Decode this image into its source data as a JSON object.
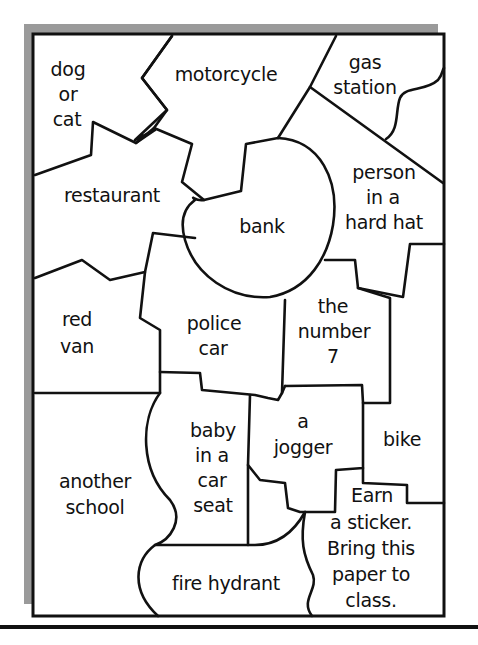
{
  "worksheet": {
    "title": "Scavenger hunt map",
    "cells": [
      {
        "id": "dog-or-cat",
        "lines": [
          "dog",
          "or",
          "cat"
        ]
      },
      {
        "id": "motorcycle",
        "lines": [
          "motorcycle"
        ]
      },
      {
        "id": "gas-station",
        "lines": [
          "gas",
          "station"
        ]
      },
      {
        "id": "restaurant",
        "lines": [
          "restaurant"
        ]
      },
      {
        "id": "bank",
        "lines": [
          "bank"
        ]
      },
      {
        "id": "person-in-a-hard-hat",
        "lines": [
          "person",
          "in a",
          "hard hat"
        ]
      },
      {
        "id": "red-van",
        "lines": [
          "red",
          "van"
        ]
      },
      {
        "id": "police-car",
        "lines": [
          "police",
          "car"
        ]
      },
      {
        "id": "the-number-7",
        "lines": [
          "the",
          "number",
          "7"
        ]
      },
      {
        "id": "baby-in-a-car-seat",
        "lines": [
          "baby",
          "in a",
          "car",
          "seat"
        ]
      },
      {
        "id": "a-jogger",
        "lines": [
          "a",
          "jogger"
        ]
      },
      {
        "id": "bike",
        "lines": [
          "bike"
        ]
      },
      {
        "id": "another-school",
        "lines": [
          "another",
          "school"
        ]
      },
      {
        "id": "fire-hydrant",
        "lines": [
          "fire hydrant"
        ]
      },
      {
        "id": "earn-sticker",
        "lines": [
          "Earn",
          "a  sticker.",
          "Bring this",
          "paper to",
          "class."
        ]
      }
    ],
    "colors": {
      "ink": "#111111",
      "shadow": "#9a9a9a",
      "paper": "#ffffff"
    }
  }
}
